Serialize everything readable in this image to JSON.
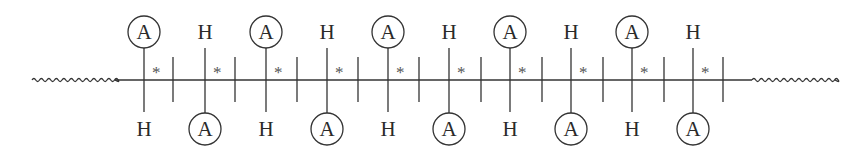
{
  "diagram": {
    "stroke_color": "#333333",
    "background": "#ffffff",
    "chain_y": 80,
    "left_wave": {
      "x1": 32,
      "x2": 115
    },
    "right_wave": {
      "x1": 752,
      "x2": 835
    },
    "main_line": {
      "x1": 115,
      "x2": 752
    },
    "separators_x": [
      173,
      235,
      297,
      358,
      419,
      481,
      542,
      603,
      664,
      723
    ],
    "stereocenters": [
      {
        "x": 144,
        "top": "A",
        "bottom": "H",
        "mark": "*"
      },
      {
        "x": 205,
        "top": "H",
        "bottom": "A",
        "mark": "*"
      },
      {
        "x": 266,
        "top": "A",
        "bottom": "H",
        "mark": "*"
      },
      {
        "x": 327,
        "top": "H",
        "bottom": "A",
        "mark": "*"
      },
      {
        "x": 388,
        "top": "A",
        "bottom": "H",
        "mark": "*"
      },
      {
        "x": 449,
        "top": "H",
        "bottom": "A",
        "mark": "*"
      },
      {
        "x": 510,
        "top": "A",
        "bottom": "H",
        "mark": "*"
      },
      {
        "x": 571,
        "top": "H",
        "bottom": "A",
        "mark": "*"
      },
      {
        "x": 632,
        "top": "A",
        "bottom": "H",
        "mark": "*"
      },
      {
        "x": 693,
        "top": "H",
        "bottom": "A",
        "mark": "*"
      }
    ],
    "legend": {
      "circled_label": "A",
      "plain_label": "H",
      "chiral_mark": "*"
    }
  }
}
